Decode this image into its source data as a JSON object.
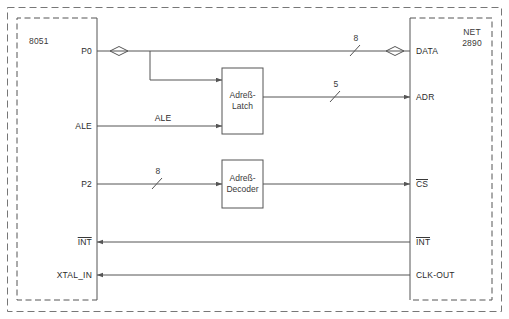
{
  "diagram": {
    "stroke_color": "#555555",
    "text_color": "#2b2b2b"
  },
  "blocks": {
    "left": {
      "name": "8051",
      "pins": [
        {
          "label": "P0",
          "overline": false
        },
        {
          "label": "ALE",
          "overline": false
        },
        {
          "label": "P2",
          "overline": false
        },
        {
          "label": "INT",
          "overline": true
        },
        {
          "label": "XTAL_IN",
          "overline": false
        }
      ]
    },
    "right": {
      "name_line1": "NET",
      "name_line2": "2890",
      "pins": [
        {
          "label": "DATA",
          "overline": false
        },
        {
          "label": "ADR",
          "overline": false
        },
        {
          "label": "CS",
          "overline": true
        },
        {
          "label": "INT",
          "overline": true
        },
        {
          "label": "CLK-OUT",
          "overline": false
        }
      ]
    },
    "middle": [
      {
        "line1": "Adreß-",
        "line2": "Latch"
      },
      {
        "line1": "Adreß-",
        "line2": "Decoder"
      }
    ]
  },
  "signals": {
    "ale_label": "ALE",
    "bus_widths": {
      "data_bus": "8",
      "addr_bus": "5",
      "p2_bus": "8"
    }
  }
}
